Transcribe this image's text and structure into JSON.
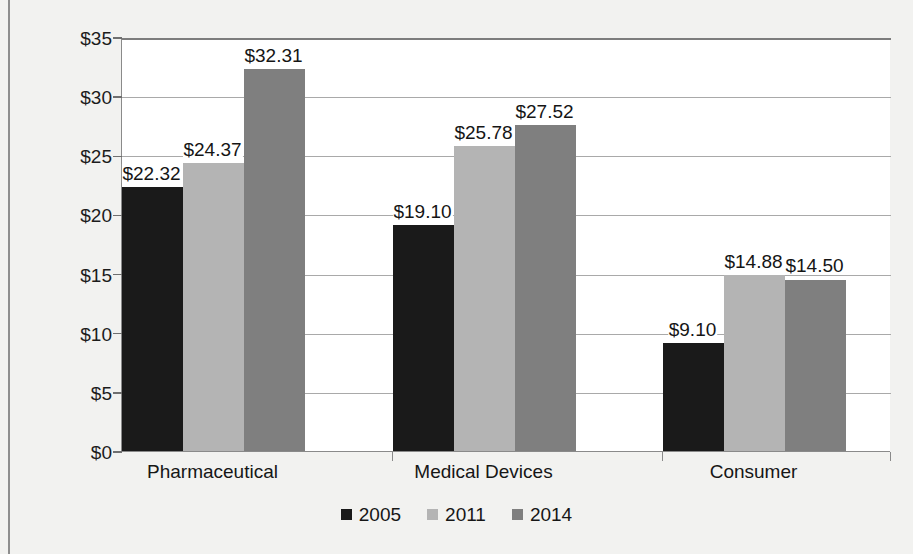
{
  "chart_data": {
    "type": "bar",
    "title": "",
    "subtitle": "",
    "xlabel": "",
    "ylabel": "",
    "ylim": [
      0,
      35
    ],
    "grid": true,
    "legend_position": "bottom",
    "currency_prefix": "$",
    "categories": [
      "Pharmaceutical",
      "Medical Devices",
      "Consumer"
    ],
    "ytick_labels": [
      "$0",
      "$5",
      "$10",
      "$15",
      "$20",
      "$25",
      "$30",
      "$35"
    ],
    "ytick_values": [
      0,
      5,
      10,
      15,
      20,
      25,
      30,
      35
    ],
    "series": [
      {
        "name": "2005",
        "color": "#1a1a1a",
        "values": [
          22.32,
          19.1,
          9.1
        ],
        "labels": [
          "$22.32",
          "$19.10",
          "$9.10"
        ]
      },
      {
        "name": "2011",
        "color": "#b4b4b4",
        "values": [
          24.37,
          25.78,
          14.88
        ],
        "labels": [
          "$24.37",
          "$25.78",
          "$14.88"
        ]
      },
      {
        "name": "2014",
        "color": "#7f7f7f",
        "values": [
          32.31,
          27.52,
          14.5
        ],
        "labels": [
          "$32.31",
          "$27.52",
          "$14.50"
        ]
      }
    ]
  },
  "legend": {
    "items": [
      {
        "label": "2005",
        "color": "#1a1a1a"
      },
      {
        "label": "2011",
        "color": "#b4b4b4"
      },
      {
        "label": "2014",
        "color": "#7f7f7f"
      }
    ]
  }
}
